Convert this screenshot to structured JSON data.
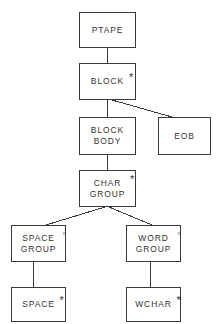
{
  "diagram": {
    "background_color": "#ffffff",
    "line_color": "#3a3a3a",
    "text_color": "#333333",
    "type": "tree",
    "nodes": [
      {
        "id": "ptape",
        "lines": [
          "PTAPE"
        ],
        "marker": "",
        "x": 79,
        "y": 12,
        "w": 57,
        "h": 36
      },
      {
        "id": "block",
        "lines": [
          "BLOCK"
        ],
        "marker": "*",
        "x": 79,
        "y": 63,
        "w": 57,
        "h": 37
      },
      {
        "id": "block-body",
        "lines": [
          "BLOCK",
          "BODY"
        ],
        "marker": "",
        "x": 79,
        "y": 117,
        "w": 57,
        "h": 38
      },
      {
        "id": "eob",
        "lines": [
          "EOB"
        ],
        "marker": "",
        "x": 158,
        "y": 117,
        "w": 53,
        "h": 38
      },
      {
        "id": "char-group",
        "lines": [
          "CHAR",
          "GROUP"
        ],
        "marker": "*",
        "x": 79,
        "y": 170,
        "w": 57,
        "h": 37
      },
      {
        "id": "space-group",
        "lines": [
          "SPACE",
          "GROUP"
        ],
        "marker": "°",
        "x": 11,
        "y": 225,
        "w": 55,
        "h": 37
      },
      {
        "id": "word-group",
        "lines": [
          "WORD",
          "GROUP"
        ],
        "marker": "°",
        "x": 126,
        "y": 225,
        "w": 55,
        "h": 37
      },
      {
        "id": "space",
        "lines": [
          "SPACE"
        ],
        "marker": "*",
        "x": 11,
        "y": 287,
        "w": 55,
        "h": 35
      },
      {
        "id": "wchar",
        "lines": [
          "WCHAR"
        ],
        "marker": "*",
        "x": 126,
        "y": 287,
        "w": 55,
        "h": 35
      }
    ],
    "edges": [
      {
        "from": "ptape",
        "to": "block",
        "x1": 107,
        "y1": 48,
        "x2": 107,
        "y2": 63
      },
      {
        "from": "block",
        "to": "block-body",
        "x1": 107,
        "y1": 100,
        "x2": 107,
        "y2": 117
      },
      {
        "from": "block",
        "to": "eob",
        "x1": 112,
        "y1": 100,
        "x2": 172,
        "y2": 117
      },
      {
        "from": "block-body",
        "to": "char-group",
        "x1": 107,
        "y1": 155,
        "x2": 107,
        "y2": 170
      },
      {
        "from": "char-group",
        "to": "space-group",
        "x1": 105,
        "y1": 207,
        "x2": 46,
        "y2": 225
      },
      {
        "from": "char-group",
        "to": "word-group",
        "x1": 109,
        "y1": 207,
        "x2": 152,
        "y2": 225
      },
      {
        "from": "space-group",
        "to": "space",
        "x1": 33,
        "y1": 262,
        "x2": 33,
        "y2": 287
      },
      {
        "from": "word-group",
        "to": "wchar",
        "x1": 150,
        "y1": 262,
        "x2": 150,
        "y2": 287
      }
    ]
  }
}
